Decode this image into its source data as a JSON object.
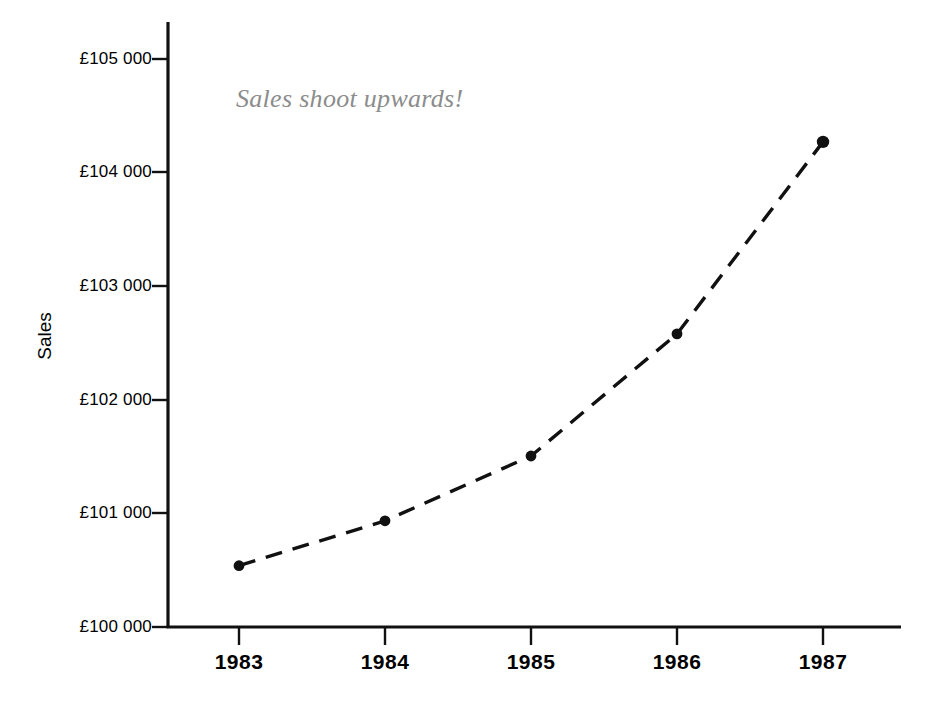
{
  "chart_data": {
    "type": "line",
    "title": "",
    "subtitle": "",
    "xlabel": "",
    "ylabel": "Sales",
    "categories": [
      "1983",
      "1984",
      "1985",
      "1986",
      "1987"
    ],
    "x": [
      1983,
      1984,
      1985,
      1986,
      1987
    ],
    "values": [
      100540,
      100935,
      101505,
      102580,
      104270
    ],
    "series": [
      {
        "name": "Sales",
        "values": [
          100540,
          100935,
          101505,
          102580,
          104270
        ]
      }
    ],
    "ylim": [
      100000,
      105000
    ],
    "xlim": [
      1982.5,
      1987.5
    ],
    "ytick_values": [
      100000,
      101000,
      102000,
      103000,
      104000,
      105000
    ],
    "ytick_labels": [
      "£100 000",
      "£101 000",
      "£102 000",
      "£103 000",
      "£104 000",
      "£105 000"
    ],
    "xtick_labels": [
      "1983",
      "1984",
      "1985",
      "1986",
      "1987"
    ],
    "grid": false,
    "legend": false,
    "legend_position": "none",
    "line_style": "dashed",
    "marker": "circle-filled",
    "line_color": "#111111",
    "marker_color": "#111111",
    "axis_color": "#111111",
    "annotations": [
      {
        "text": "Sales shoot upwards!",
        "x": 1983.0,
        "y": 104560,
        "color": "#8c8c8c",
        "style": "italic-serif"
      }
    ]
  },
  "axes": {
    "y_title": "Sales",
    "y_labels": [
      "£105 000",
      "£104 000",
      "£103 000",
      "£102 000",
      "£101 000",
      "£100 000"
    ],
    "x_labels": [
      "1983",
      "1984",
      "1985",
      "1986",
      "1987"
    ]
  },
  "annotation": {
    "text": "Sales shoot upwards!"
  },
  "colors": {
    "ink": "#111111",
    "annotation": "#8c8c8c",
    "background": "#ffffff"
  }
}
